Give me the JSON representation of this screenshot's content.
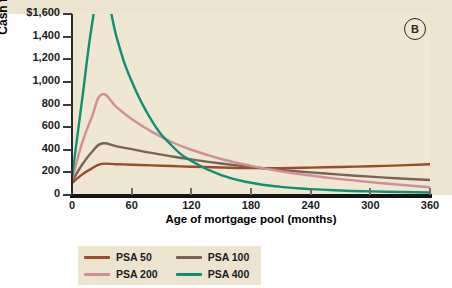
{
  "panel": {
    "badge": "B"
  },
  "chart_data": {
    "type": "line",
    "title": "",
    "xlabel": "Age of mortgage pool (months)",
    "ylabel": "Cash flows",
    "xlim": [
      0,
      360
    ],
    "ylim": [
      0,
      1600
    ],
    "grid": false,
    "legend_position": "bottom-left",
    "xticks": [
      0,
      60,
      120,
      180,
      240,
      300,
      360
    ],
    "xticklabels": [
      "0",
      "60",
      "120",
      "180",
      "240",
      "300",
      "360"
    ],
    "yticks": [
      0,
      200,
      400,
      600,
      800,
      1000,
      1200,
      1400,
      1600
    ],
    "yticklabels": [
      "0",
      "200",
      "400",
      "600",
      "800",
      "1,000",
      "1,200",
      "1,400",
      "$1,600"
    ],
    "x": [
      0,
      10,
      20,
      30,
      45,
      60,
      80,
      100,
      120,
      150,
      180,
      210,
      240,
      270,
      300,
      330,
      360
    ],
    "series": [
      {
        "name": "PSA 50",
        "color": "#9c4a2a",
        "values": [
          105,
          180,
          235,
          275,
          272,
          268,
          262,
          256,
          250,
          243,
          238,
          238,
          242,
          248,
          254,
          262,
          272
        ]
      },
      {
        "name": "PSA 100",
        "color": "#7a6257",
        "values": [
          120,
          265,
          380,
          455,
          430,
          405,
          372,
          342,
          315,
          278,
          248,
          222,
          200,
          180,
          162,
          146,
          132
        ]
      },
      {
        "name": "PSA 200",
        "color": "#d08f97",
        "values": [
          135,
          455,
          690,
          890,
          775,
          672,
          560,
          470,
          400,
          318,
          258,
          210,
          172,
          140,
          114,
          90,
          68
        ]
      },
      {
        "name": "PSA 400",
        "color": "#0f9070",
        "values": [
          160,
          830,
          1500,
          1920,
          1390,
          1005,
          660,
          440,
          300,
          175,
          108,
          72,
          52,
          40,
          32,
          26,
          22
        ]
      }
    ]
  },
  "legend": {
    "items": [
      {
        "label": "PSA 50",
        "color": "#9c4a2a"
      },
      {
        "label": "PSA 100",
        "color": "#7a6257"
      },
      {
        "label": "PSA 200",
        "color": "#d08f97"
      },
      {
        "label": "PSA 400",
        "color": "#0f9070"
      }
    ]
  }
}
